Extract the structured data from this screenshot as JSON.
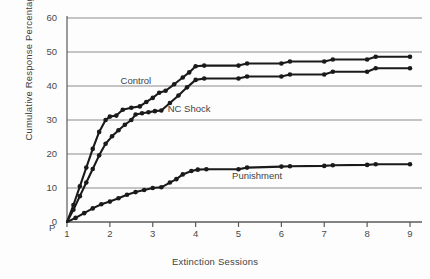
{
  "chart_data": {
    "type": "line",
    "title": "",
    "xlabel": "Extinction Sessions",
    "ylabel": "Cumulative Response Percentage",
    "xlim": [
      1,
      9
    ],
    "ylim": [
      0,
      60
    ],
    "yticks": [
      0,
      10,
      20,
      30,
      40,
      50,
      60
    ],
    "xticks": [
      1,
      2,
      3,
      4,
      5,
      6,
      7,
      8,
      9
    ],
    "origin_marker": "P",
    "origin_value": "0",
    "grid": "horizontal",
    "legend_position": "inline-annotations",
    "series": [
      {
        "name": "Control",
        "label_x": 2.25,
        "label_y": 41.5,
        "color": "#1a1a1a",
        "x": [
          1,
          1.15,
          1.3,
          1.45,
          1.6,
          1.75,
          1.9,
          2.0,
          2.15,
          2.3,
          2.5,
          2.7,
          2.85,
          3.0,
          3.15,
          3.3,
          3.5,
          3.7,
          3.85,
          4.0,
          4.2,
          5.0,
          5.2,
          6.0,
          6.2,
          7.0,
          7.2,
          8.0,
          8.2,
          9.0
        ],
        "y": [
          0,
          5.0,
          10.5,
          16.0,
          21.5,
          26.5,
          30.0,
          31.0,
          31.3,
          33.0,
          33.6,
          34.0,
          35.3,
          36.5,
          38.0,
          38.6,
          40.5,
          42.5,
          44.0,
          45.8,
          46.0,
          46.0,
          46.6,
          46.6,
          47.2,
          47.2,
          47.8,
          47.8,
          48.6,
          48.6
        ]
      },
      {
        "name": "NC Shock",
        "label_x": 3.35,
        "label_y": 33.2,
        "color": "#1a1a1a",
        "x": [
          1,
          1.15,
          1.3,
          1.45,
          1.6,
          1.75,
          1.9,
          2.05,
          2.2,
          2.35,
          2.5,
          2.6,
          2.75,
          2.9,
          3.05,
          3.2,
          3.4,
          3.6,
          3.8,
          4.0,
          4.2,
          5.0,
          5.2,
          6.0,
          6.2,
          7.0,
          7.2,
          8.0,
          8.2,
          9.0
        ],
        "y": [
          0,
          3.6,
          7.6,
          11.6,
          15.6,
          19.6,
          23.0,
          25.2,
          27.0,
          28.6,
          30.0,
          31.6,
          32.0,
          32.3,
          32.6,
          32.8,
          35.0,
          37.2,
          39.6,
          41.8,
          42.2,
          42.2,
          42.8,
          42.8,
          43.4,
          43.4,
          44.2,
          44.2,
          45.2,
          45.2
        ]
      },
      {
        "name": "Punishment",
        "label_x": 4.85,
        "label_y": 13.4,
        "color": "#1a1a1a",
        "x": [
          1,
          1.2,
          1.4,
          1.6,
          1.8,
          2.0,
          2.2,
          2.4,
          2.6,
          2.8,
          3.0,
          3.2,
          3.4,
          3.55,
          3.7,
          3.9,
          4.05,
          4.25,
          5.0,
          5.2,
          6.0,
          6.2,
          7.0,
          7.2,
          8.0,
          8.2,
          9.0
        ],
        "y": [
          0,
          1.2,
          2.6,
          4.0,
          5.2,
          6.0,
          7.0,
          8.0,
          8.8,
          9.4,
          10.0,
          10.2,
          11.6,
          12.6,
          14.0,
          15.0,
          15.4,
          15.5,
          15.5,
          16.0,
          16.3,
          16.4,
          16.5,
          16.7,
          16.8,
          17.0,
          17.0
        ]
      }
    ]
  },
  "axis": {
    "y_tick_labels": [
      "60",
      "50",
      "40",
      "30",
      "20",
      "10",
      "0"
    ],
    "x_tick_labels": [
      "1",
      "2",
      "3",
      "4",
      "5",
      "6",
      "7",
      "8",
      "9"
    ],
    "p_label": "P",
    "zero_label": "0"
  },
  "colors": {
    "gridline": "#8c8c8c",
    "axis": "#5a5a5a",
    "curve": "#1a1a1a",
    "text": "#3f3f3f",
    "background": "#fdfdfd"
  }
}
